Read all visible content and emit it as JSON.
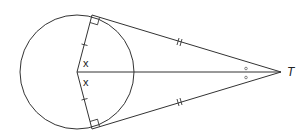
{
  "diagram": {
    "circle": {
      "cx": 77,
      "cy": 72,
      "r": 57
    },
    "center": {
      "x": 77,
      "y": 72
    },
    "external_point": {
      "label": "T",
      "x": 281,
      "y": 72
    },
    "tangent_points": [
      {
        "name": "upper",
        "x": 92,
        "y": 15
      },
      {
        "name": "lower",
        "x": 92,
        "y": 129
      }
    ],
    "angle_labels": [
      {
        "text": "x",
        "x": 83,
        "y": 66
      },
      {
        "text": "x",
        "x": 83,
        "y": 86
      }
    ],
    "point_label": "T",
    "markings": {
      "radii_equal": "single tick",
      "tangents_equal": "double tick",
      "right_angles": "square at tangent points",
      "equal_angles_at_T": "small circle marks"
    },
    "colors": {
      "stroke": "#333333",
      "background": "#ffffff"
    }
  }
}
